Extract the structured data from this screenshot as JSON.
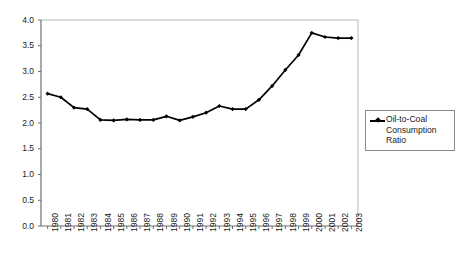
{
  "chart_data": {
    "type": "line",
    "title": "",
    "subtitle": "",
    "xlabel": "",
    "ylabel": "",
    "grid": false,
    "legend_position": "right",
    "ylim": [
      0.0,
      4.0
    ],
    "ytick_step": 0.5,
    "ytick_labels": [
      "4.0",
      "3.5",
      "3.0",
      "2.5",
      "2.0",
      "1.5",
      "1.0",
      "0.5",
      "0.0"
    ],
    "ytick_values": [
      4.0,
      3.5,
      3.0,
      2.5,
      2.0,
      1.5,
      1.0,
      0.5,
      0.0
    ],
    "categories": [
      "1980",
      "1981",
      "1982",
      "1983",
      "1984",
      "1985",
      "1986",
      "1987",
      "1988",
      "1989",
      "1990",
      "1991",
      "1992",
      "1993",
      "1994",
      "1995",
      "1996",
      "1997",
      "1998",
      "1999",
      "2000",
      "2001",
      "2002",
      "2003"
    ],
    "series": [
      {
        "name": "Oil-to-Coal Consumption Ratio",
        "marker": "diamond",
        "color": "#000000",
        "values": [
          2.57,
          2.5,
          2.3,
          2.27,
          2.06,
          2.05,
          2.07,
          2.06,
          2.06,
          2.13,
          2.05,
          2.12,
          2.2,
          2.33,
          2.27,
          2.27,
          2.45,
          2.72,
          3.03,
          3.32,
          3.75,
          3.67,
          3.65,
          3.65
        ]
      }
    ]
  },
  "legend": {
    "label": "Oil-to-Coal Consumption Ratio"
  },
  "colors": {
    "series": "#000000",
    "axis": "#808080",
    "plot_border": "#b0b0b0",
    "legend_border": "#8a8a8a",
    "text": "#1a1a1a",
    "background": "#ffffff"
  }
}
